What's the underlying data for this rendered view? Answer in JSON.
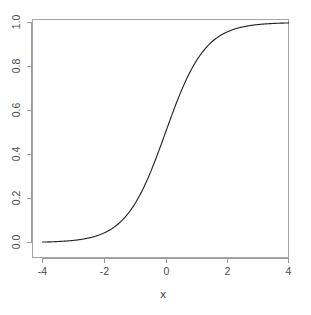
{
  "chart_data": {
    "type": "line",
    "title": "",
    "subtitle": "",
    "xlabel": "x",
    "ylabel": "",
    "xlim": [
      -4.4,
      4.4
    ],
    "ylim": [
      -0.04,
      1.04
    ],
    "grid": false,
    "legend": null,
    "x_ticks": [
      -4,
      -2,
      0,
      2,
      4
    ],
    "x_tick_labels": [
      "-4",
      "-2",
      "0",
      "2",
      "4"
    ],
    "y_ticks": [
      0.0,
      0.2,
      0.4,
      0.6,
      0.8,
      1.0
    ],
    "y_tick_labels": [
      "0.0",
      "0.2",
      "0.4",
      "0.6",
      "0.8",
      "1.0"
    ],
    "y_tick_labels_rotated": true,
    "line_color": "#262626",
    "background_color": "#ffffff",
    "axis_color": "#9a9a9a",
    "series": [
      {
        "name": "logistic",
        "formula": "1 / (1 + exp(-1.55 * x))",
        "x": [
          -4.4,
          -4.2,
          -4.0,
          -3.8,
          -3.6,
          -3.4,
          -3.2,
          -3.0,
          -2.8,
          -2.6,
          -2.4,
          -2.2,
          -2.0,
          -1.8,
          -1.6,
          -1.4,
          -1.2,
          -1.0,
          -0.8,
          -0.6,
          -0.4,
          -0.2,
          0.0,
          0.2,
          0.4,
          0.6,
          0.8,
          1.0,
          1.2,
          1.4,
          1.6,
          1.8,
          2.0,
          2.2,
          2.4,
          2.6,
          2.8,
          3.0,
          3.2,
          3.4,
          3.6,
          3.8,
          4.0,
          4.2,
          4.4
        ],
        "values": [
          0.001,
          0.002,
          0.002,
          0.003,
          0.004,
          0.005,
          0.007,
          0.009,
          0.013,
          0.017,
          0.024,
          0.032,
          0.043,
          0.058,
          0.078,
          0.103,
          0.135,
          0.175,
          0.224,
          0.282,
          0.348,
          0.423,
          0.5,
          0.577,
          0.652,
          0.718,
          0.776,
          0.825,
          0.865,
          0.897,
          0.922,
          0.942,
          0.957,
          0.968,
          0.976,
          0.983,
          0.987,
          0.991,
          0.993,
          0.995,
          0.996,
          0.997,
          0.998,
          0.998,
          0.999
        ]
      }
    ]
  },
  "plot": {
    "x_axis_title": "x",
    "y_axis_title": ""
  }
}
